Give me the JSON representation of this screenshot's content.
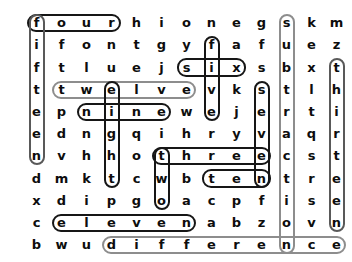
{
  "puzzle": {
    "type": "word-search",
    "rows": 11,
    "cols": 13,
    "grid": [
      [
        "f",
        "o",
        "u",
        "r",
        "h",
        "i",
        "o",
        "n",
        "e",
        "g",
        "s",
        "k",
        "m"
      ],
      [
        "i",
        "f",
        "o",
        "n",
        "t",
        "g",
        "y",
        "f",
        "a",
        "f",
        "u",
        "e",
        "z"
      ],
      [
        "f",
        "t",
        "l",
        "u",
        "e",
        "j",
        "s",
        "i",
        "x",
        "s",
        "b",
        "x",
        "t"
      ],
      [
        "t",
        "t",
        "w",
        "e",
        "l",
        "v",
        "e",
        "v",
        "k",
        "s",
        "t",
        "l",
        "h"
      ],
      [
        "e",
        "p",
        "n",
        "i",
        "n",
        "e",
        "w",
        "e",
        "j",
        "e",
        "r",
        "t",
        "i"
      ],
      [
        "e",
        "d",
        "n",
        "g",
        "q",
        "i",
        "h",
        "r",
        "y",
        "v",
        "a",
        "q",
        "r"
      ],
      [
        "n",
        "v",
        "h",
        "h",
        "o",
        "t",
        "h",
        "r",
        "e",
        "e",
        "c",
        "s",
        "t"
      ],
      [
        "d",
        "m",
        "k",
        "t",
        "c",
        "w",
        "b",
        "t",
        "e",
        "n",
        "t",
        "r",
        "e"
      ],
      [
        "x",
        "d",
        "i",
        "p",
        "g",
        "o",
        "a",
        "c",
        "p",
        "f",
        "i",
        "s",
        "e"
      ],
      [
        "c",
        "e",
        "l",
        "e",
        "v",
        "e",
        "n",
        "a",
        "b",
        "z",
        "o",
        "v",
        "n"
      ],
      [
        "b",
        "w",
        "u",
        "d",
        "i",
        "f",
        "f",
        "e",
        "r",
        "e",
        "n",
        "c",
        "e"
      ]
    ],
    "found_words": [
      {
        "id": "four",
        "text": "four",
        "orientation": "horizontal",
        "row": 0,
        "col_start": 0,
        "col_end": 3,
        "color": "dark"
      },
      {
        "id": "fifteen",
        "text": "fifteen",
        "orientation": "vertical",
        "col": 0,
        "row_start": 0,
        "row_end": 6,
        "color": "mid"
      },
      {
        "id": "six",
        "text": "six",
        "orientation": "horizontal",
        "row": 2,
        "col_start": 6,
        "col_end": 8,
        "color": "dark"
      },
      {
        "id": "five",
        "text": "five",
        "orientation": "vertical",
        "col": 7,
        "row_start": 1,
        "row_end": 4,
        "color": "dark"
      },
      {
        "id": "twelve",
        "text": "twelve",
        "orientation": "horizontal",
        "row": 3,
        "col_start": 1,
        "col_end": 6,
        "color": "light"
      },
      {
        "id": "eight",
        "text": "eight",
        "orientation": "vertical",
        "col": 3,
        "row_start": 3,
        "row_end": 7,
        "color": "dark"
      },
      {
        "id": "nine",
        "text": "nine",
        "orientation": "horizontal",
        "row": 4,
        "col_start": 2,
        "col_end": 5,
        "color": "dark"
      },
      {
        "id": "seven",
        "text": "seven",
        "orientation": "vertical",
        "col": 9,
        "row_start": 3,
        "row_end": 7,
        "color": "dark"
      },
      {
        "id": "three",
        "text": "three",
        "orientation": "horizontal",
        "row": 6,
        "col_start": 5,
        "col_end": 9,
        "color": "dark"
      },
      {
        "id": "two",
        "text": "two",
        "orientation": "vertical",
        "col": 5,
        "row_start": 6,
        "row_end": 8,
        "color": "dark"
      },
      {
        "id": "ten",
        "text": "ten",
        "orientation": "horizontal",
        "row": 7,
        "col_start": 7,
        "col_end": 9,
        "color": "dark"
      },
      {
        "id": "eleven",
        "text": "eleven",
        "orientation": "horizontal",
        "row": 9,
        "col_start": 1,
        "col_end": 6,
        "color": "dark"
      },
      {
        "id": "subtraction",
        "text": "subtraction",
        "orientation": "vertical",
        "col": 10,
        "row_start": 0,
        "row_end": 10,
        "color": "light"
      },
      {
        "id": "thirteen",
        "text": "thirteen",
        "orientation": "vertical",
        "col": 12,
        "row_start": 2,
        "row_end": 9,
        "color": "mid"
      },
      {
        "id": "difference",
        "text": "difference",
        "orientation": "horizontal",
        "row": 10,
        "col_start": 3,
        "col_end": 12,
        "color": "light"
      }
    ],
    "colors": {
      "dark": "#161616",
      "mid": "#595959",
      "light": "#8d8d8d",
      "letter": "#0d0d0d",
      "background": "#ffffff"
    },
    "geometry": {
      "origin_x": 24,
      "origin_y": 12,
      "cell_width": 25.0,
      "cell_height": 22.2,
      "letter_box_w": 26,
      "letter_box_h": 22
    }
  }
}
